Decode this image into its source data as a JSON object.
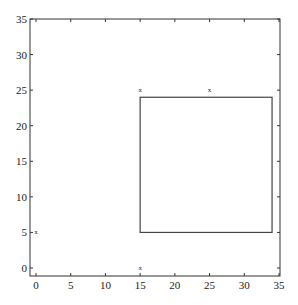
{
  "chart_data": {
    "type": "scatter",
    "title": "",
    "xlabel": "",
    "ylabel": "",
    "xlim": [
      -1,
      35
    ],
    "ylim": [
      -1,
      35
    ],
    "x_ticks": [
      0,
      5,
      10,
      15,
      20,
      25,
      30,
      35
    ],
    "y_ticks": [
      0,
      5,
      10,
      15,
      20,
      25,
      30,
      35
    ],
    "x_tick_labels": [
      "0",
      "5",
      "10",
      "15",
      "20",
      "25",
      "30",
      "35"
    ],
    "y_tick_labels": [
      "0",
      "5",
      "10",
      "15",
      "20",
      "25",
      "30",
      "35"
    ],
    "grid": false,
    "legend": null,
    "series": [
      {
        "name": "points",
        "marker": "x",
        "points": [
          {
            "x": 15,
            "y": 25
          },
          {
            "x": 25,
            "y": 25
          },
          {
            "x": 0,
            "y": 5
          },
          {
            "x": 15,
            "y": 0
          }
        ]
      }
    ],
    "shapes": [
      {
        "type": "rectangle",
        "x0": 15,
        "y0": 5,
        "x1": 34,
        "y1": 24
      }
    ]
  },
  "style": {
    "axis_color": "#333333",
    "rect_color": "#444444",
    "text_color": "#222222",
    "background": "#ffffff"
  }
}
